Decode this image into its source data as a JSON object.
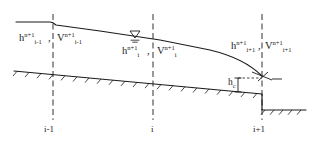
{
  "figure": {
    "ink_color": "#1a1a1a",
    "background": "#ffffff"
  },
  "labels": {
    "left_depth": {
      "base": "h",
      "sup": "n+1",
      "sub": "i-1"
    },
    "left_velocity": {
      "base": "V",
      "sup": "n+1",
      "sub": "i-1"
    },
    "mid_depth": {
      "base": "h",
      "sup": "n+1",
      "sub": "i"
    },
    "mid_velocity": {
      "base": "V",
      "sup": "n+1",
      "sub": "i"
    },
    "right_depth": {
      "base": "h",
      "sup": "n+1",
      "sub": "i+1"
    },
    "right_velocity": {
      "base": "V",
      "sup": "n+1",
      "sub": "i+1"
    },
    "critical_depth": {
      "base": "h",
      "sub": "c"
    },
    "separator": ","
  },
  "nodes": [
    {
      "name": "node-i-minus-1",
      "label": "i-1",
      "x": 53
    },
    {
      "name": "node-i",
      "label": "i",
      "x": 153
    },
    {
      "name": "node-i-plus-1",
      "label": "i+1",
      "x": 262
    }
  ],
  "symbols": {
    "water_surface_marker": "water-surface-triangle",
    "hatching": "ground-hatch"
  }
}
